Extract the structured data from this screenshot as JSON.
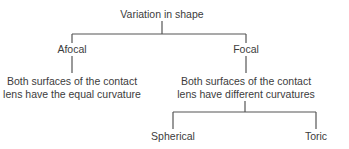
{
  "diagram": {
    "root": {
      "label": "Variation in shape"
    },
    "branches": [
      {
        "label": "Afocal",
        "description_lines": [
          "Both surfaces of the contact",
          "lens have the equal curvature"
        ]
      },
      {
        "label": "Focal",
        "description_lines": [
          "Both surfaces of the contact",
          "lens have different curvatures"
        ],
        "children": [
          {
            "label": "Spherical"
          },
          {
            "label": "Toric"
          }
        ]
      }
    ],
    "colors": {
      "line": "#555555",
      "text": "#3c3c3c",
      "background": "#ffffff"
    }
  }
}
